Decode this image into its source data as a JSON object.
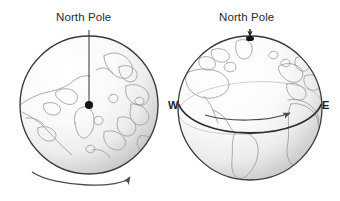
{
  "figure": {
    "background_color": "#ffffff",
    "globes": [
      {
        "id": "polar-view",
        "view": "north-polar",
        "label": "North Pole",
        "pole_marker": "dot",
        "axis_line": true,
        "rotation_arrow": {
          "position": "below",
          "direction": "rightward",
          "meaning": "counterclockwise rotation viewed from above north pole"
        },
        "center": {
          "x": 89,
          "y": 105
        },
        "radius": 69,
        "outline_color": "#3a3a3a",
        "coastline_color": "#9a9a9a",
        "shading": "radial light upper-left to gray lower-right"
      },
      {
        "id": "equatorial-view",
        "view": "side-equatorial",
        "label": "North Pole",
        "pole_marker": "dot",
        "pointer_line": true,
        "west_label": "W",
        "east_label": "E",
        "equator_line": true,
        "rotation_arrow": {
          "position": "along-equator",
          "direction": "eastward",
          "meaning": "Earth spins west to east"
        },
        "center": {
          "x": 250,
          "y": 108
        },
        "radius": 72,
        "outline_color": "#3a3a3a",
        "coastline_color": "#9a9a9a",
        "shading": "radial light upper-left to gray lower-right"
      }
    ],
    "colors": {
      "text": "#2b2b2b",
      "outline": "#3a3a3a",
      "coastline": "#9a9a9a",
      "arrow": "#4a4a4a",
      "marker": "#1a1a1a",
      "shade_light": "#ffffff",
      "shade_dark": "#c9c9c9"
    }
  }
}
